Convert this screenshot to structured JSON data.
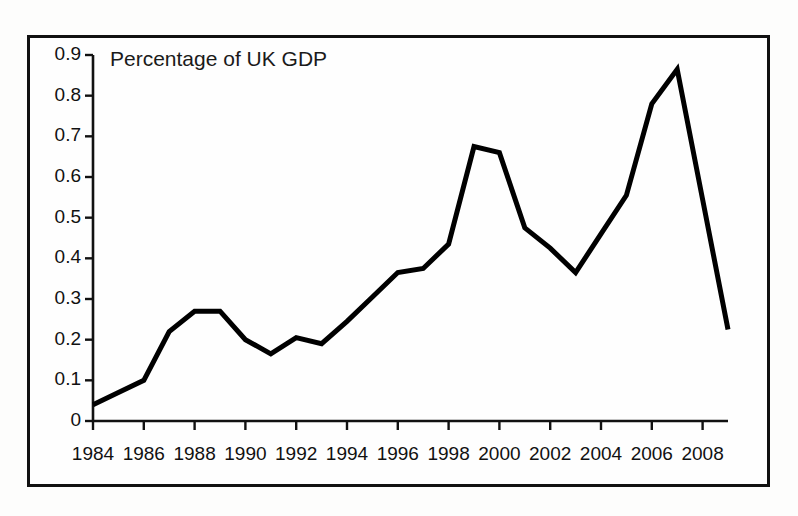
{
  "chart_data": {
    "type": "line",
    "title": "Percentage of UK GDP",
    "xlabel": "",
    "ylabel": "",
    "ylim": [
      0,
      0.9
    ],
    "xlim": [
      1984,
      2009
    ],
    "grid": false,
    "legend": "none",
    "ytick_labels": [
      "0.9",
      "0.8",
      "0.7",
      "0.6",
      "0.5",
      "0.4",
      "0.3",
      "0.2",
      "0.1",
      "0"
    ],
    "ytick_values": [
      0.9,
      0.8,
      0.7,
      0.6,
      0.5,
      0.4,
      0.3,
      0.2,
      0.1,
      0
    ],
    "xtick_labels": [
      "1984",
      "1986",
      "1988",
      "1990",
      "1992",
      "1994",
      "1996",
      "1998",
      "2000",
      "2002",
      "2004",
      "2006",
      "2008"
    ],
    "xtick_values": [
      1984,
      1986,
      1988,
      1990,
      1992,
      1994,
      1996,
      1998,
      2000,
      2002,
      2004,
      2006,
      2008
    ],
    "x": [
      1984,
      1985,
      1986,
      1987,
      1988,
      1989,
      1990,
      1991,
      1992,
      1993,
      1994,
      1995,
      1996,
      1997,
      1998,
      1999,
      2000,
      2001,
      2002,
      2003,
      2004,
      2005,
      2006,
      2007,
      2008,
      2009
    ],
    "values": [
      0.04,
      0.07,
      0.1,
      0.22,
      0.27,
      0.27,
      0.2,
      0.165,
      0.205,
      0.19,
      0.245,
      0.305,
      0.365,
      0.375,
      0.435,
      0.675,
      0.66,
      0.475,
      0.425,
      0.365,
      0.46,
      0.555,
      0.78,
      0.865,
      0.545,
      0.225
    ],
    "series_color": "#000000",
    "line_width": 5,
    "axis_color": "#111111",
    "frame_color": "#111111",
    "background": "#fefefe"
  }
}
